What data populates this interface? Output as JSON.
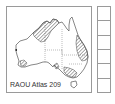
{
  "map": {
    "label": "RAOU Atlas 209",
    "region": "Australia",
    "colors": {
      "outline": "#555555",
      "hatch": "#444444",
      "frame": "#9a9a9a",
      "state_border": "#777777"
    },
    "hatched_regions": [
      "kimberley-nt-north",
      "queensland-east-coast",
      "victoria-nsw-south",
      "western-australia-south-coast",
      "south-australia-gulf"
    ]
  },
  "sidebar": {
    "box_count": 6,
    "boxes": [
      "",
      "",
      "",
      "",
      "",
      ""
    ]
  }
}
